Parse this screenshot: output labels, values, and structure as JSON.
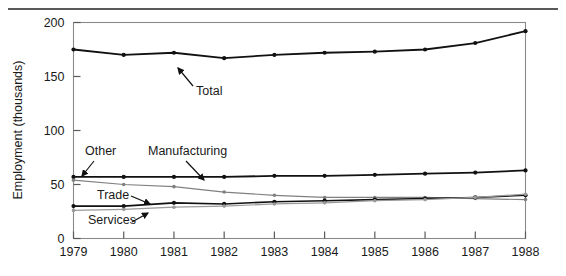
{
  "figure": {
    "top_rule": "horizontal-rule"
  },
  "axes": {
    "y_title": "Employment (thousands)",
    "y_ticks": [
      "0",
      "50",
      "100",
      "150",
      "200"
    ],
    "x_ticks": [
      "1979",
      "1980",
      "1981",
      "1982",
      "1983",
      "1984",
      "1985",
      "1986",
      "1987",
      "1988"
    ]
  },
  "annotations": [
    {
      "key": "total",
      "label": "Total"
    },
    {
      "key": "other",
      "label": "Other"
    },
    {
      "key": "manufacturing",
      "label": "Manufacturing"
    },
    {
      "key": "trade",
      "label": "Trade"
    },
    {
      "key": "services",
      "label": "Services"
    }
  ],
  "chart_data": {
    "type": "line",
    "title": "",
    "xlabel": "",
    "ylabel": "Employment (thousands)",
    "x": [
      1979,
      1980,
      1981,
      1982,
      1983,
      1984,
      1985,
      1986,
      1987,
      1988
    ],
    "categories": [
      "1979",
      "1980",
      "1981",
      "1982",
      "1983",
      "1984",
      "1985",
      "1986",
      "1987",
      "1988"
    ],
    "xlim": [
      1979,
      1988
    ],
    "ylim": [
      0,
      200
    ],
    "yticks": [
      0,
      50,
      100,
      150,
      200
    ],
    "grid": false,
    "legend": "inline-annotations",
    "series": [
      {
        "name": "Total",
        "color": "#111111",
        "width": 1.8,
        "marker": "dot",
        "values": [
          175,
          170,
          172,
          167,
          170,
          172,
          173,
          175,
          181,
          192
        ]
      },
      {
        "name": "Other",
        "color": "#111111",
        "width": 1.8,
        "marker": "dot",
        "values": [
          57,
          57,
          57,
          57,
          58,
          58,
          59,
          60,
          61,
          63
        ]
      },
      {
        "name": "Manufacturing",
        "color": "#808080",
        "width": 1.2,
        "marker": "dot",
        "values": [
          54,
          50,
          48,
          43,
          40,
          38,
          38,
          38,
          37,
          36
        ]
      },
      {
        "name": "Trade",
        "color": "#111111",
        "width": 1.6,
        "marker": "dot",
        "values": [
          30,
          30,
          33,
          32,
          34,
          35,
          36,
          37,
          38,
          40
        ]
      },
      {
        "name": "Services",
        "color": "#9a9a9a",
        "width": 1.2,
        "marker": "dot",
        "values": [
          26,
          27,
          29,
          30,
          32,
          33,
          35,
          36,
          38,
          41
        ]
      }
    ]
  }
}
